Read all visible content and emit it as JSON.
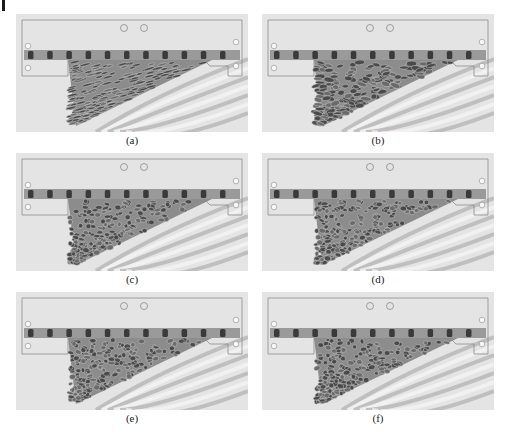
{
  "figure": {
    "panels": [
      {
        "id": "a",
        "label": "(a)"
      },
      {
        "id": "b",
        "label": "(b)"
      },
      {
        "id": "c",
        "label": "(c)"
      },
      {
        "id": "d",
        "label": "(d)"
      },
      {
        "id": "e",
        "label": "(e)"
      },
      {
        "id": "f",
        "label": "(f)"
      }
    ],
    "colors": {
      "background": "#e4e4e4",
      "frame_line": "#8a8a8a",
      "strip_light": "#9a9a9a",
      "strip_dark": "#3a3a3a",
      "pattern_dark": "#4a4a4a",
      "pattern_mid": "#8c8c8c",
      "streak": "#b5b5b5"
    }
  }
}
